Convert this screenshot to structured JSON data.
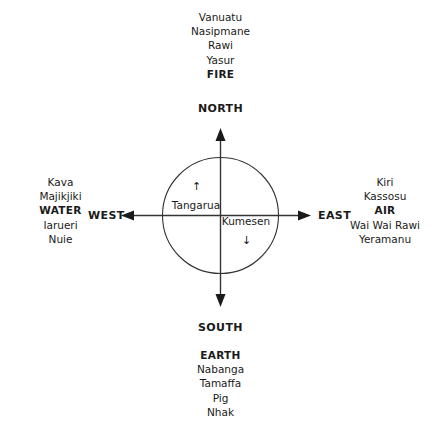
{
  "diagram": {
    "line_color": "#333333",
    "text_color": "#1a1a1a",
    "background": "#ffffff"
  },
  "cardinals": {
    "north": "NORTH",
    "south": "SOUTH",
    "east": "EAST",
    "west": "WEST"
  },
  "quadrants": {
    "north": {
      "element": "FIRE",
      "items": [
        "Vanuatu",
        "Nasipmane",
        "Rawi",
        "Yasur"
      ]
    },
    "south": {
      "element": "EARTH",
      "items": [
        "Nabanga",
        "Tamaffa",
        "Pig",
        "Nhak"
      ]
    },
    "west": {
      "element": "WATER",
      "items_above": [
        "Kava",
        "Majikjiki"
      ],
      "items_below": [
        "Iarueri",
        "Nuie"
      ]
    },
    "east": {
      "element": "AIR",
      "items_above": [
        "Kiri",
        "Kassosu"
      ],
      "items_below": [
        "Wai Wai Rawi",
        "Yeramanu"
      ]
    }
  },
  "center": {
    "upper_left": {
      "label": "Tangarua",
      "arrow": "↑",
      "arrow_name": "up-arrow-icon"
    },
    "lower_right": {
      "label": "Kumesen",
      "arrow": "↓",
      "arrow_name": "down-arrow-icon"
    }
  }
}
